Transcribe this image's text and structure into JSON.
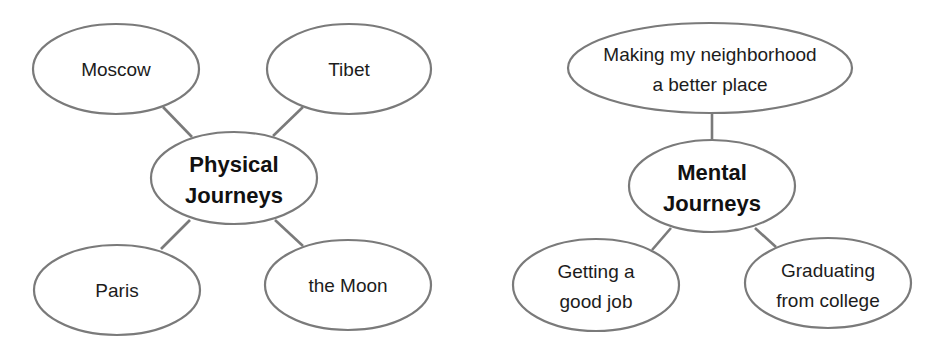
{
  "diagrams": {
    "physical": {
      "center": {
        "line1": "Physical",
        "line2": "Journeys"
      },
      "nodes": {
        "moscow": "Moscow",
        "tibet": "Tibet",
        "paris": "Paris",
        "moon": "the Moon"
      }
    },
    "mental": {
      "center": {
        "line1": "Mental",
        "line2": "Journeys"
      },
      "nodes": {
        "neighborhood": {
          "line1": "Making my neighborhood",
          "line2": "a better place"
        },
        "job": {
          "line1": "Getting a",
          "line2": "good job"
        },
        "college": {
          "line1": "Graduating",
          "line2": "from college"
        }
      }
    }
  },
  "colors": {
    "stroke": "#7a7a7a",
    "text": "#1c1c1c",
    "background": "#ffffff"
  }
}
